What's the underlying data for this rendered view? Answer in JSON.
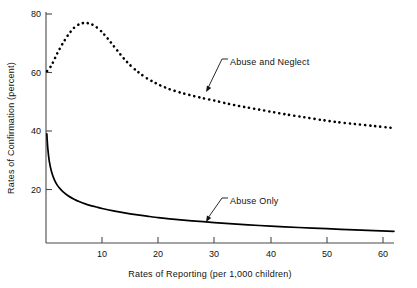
{
  "chart_data": {
    "type": "line",
    "title": "",
    "xlabel": "Rates of Reporting (per 1,000 children)",
    "ylabel": "Rates of Confirmation (percent)",
    "xlim": [
      0,
      62
    ],
    "ylim": [
      2,
      80
    ],
    "xticks": [
      10,
      20,
      30,
      40,
      50,
      60
    ],
    "yticks": [
      20,
      40,
      60,
      80
    ],
    "grid": false,
    "legend_position": "inline-annotations",
    "series": [
      {
        "name": "Abuse and Neglect",
        "style": "dotted",
        "x": [
          0.2,
          1,
          2,
          3,
          4,
          5,
          6,
          7,
          8,
          9,
          10,
          11,
          12,
          13,
          14,
          15,
          16,
          17,
          18,
          19,
          20,
          22,
          24,
          26,
          28,
          30,
          32,
          34,
          36,
          38,
          40,
          43,
          46,
          49,
          52,
          55,
          58,
          62
        ],
        "values": [
          60.5,
          62.5,
          66.5,
          70.0,
          73.0,
          75.3,
          76.6,
          77.0,
          76.6,
          75.5,
          73.8,
          71.6,
          69.2,
          66.8,
          64.5,
          62.5,
          60.8,
          59.3,
          58.0,
          56.9,
          55.9,
          54.3,
          53.1,
          52.1,
          51.2,
          50.4,
          49.5,
          48.7,
          48.0,
          47.3,
          46.6,
          45.6,
          44.7,
          43.8,
          43.0,
          42.4,
          41.8,
          41.0
        ]
      },
      {
        "name": "Abuse Only",
        "style": "solid",
        "x": [
          0.15,
          0.3,
          0.6,
          1,
          1.5,
          2,
          2.5,
          3,
          4,
          5,
          6,
          7,
          8,
          9,
          10,
          12,
          14,
          16,
          18,
          20,
          24,
          28,
          32,
          36,
          40,
          45,
          50,
          55,
          62
        ],
        "values": [
          39.0,
          34.5,
          29.5,
          26.0,
          23.3,
          21.5,
          20.3,
          19.3,
          17.8,
          16.7,
          15.8,
          15.1,
          14.5,
          14.0,
          13.5,
          12.7,
          12.0,
          11.4,
          10.9,
          10.4,
          9.6,
          9.0,
          8.4,
          7.9,
          7.5,
          7.0,
          6.6,
          6.2,
          5.7
        ]
      }
    ],
    "annotations": [
      {
        "text": "Abuse and Neglect",
        "label_x": 230,
        "label_y": 62,
        "point_x": 206,
        "point_y": 92
      },
      {
        "text": "Abuse Only",
        "label_x": 230,
        "label_y": 201,
        "point_x": 206,
        "point_y": 222
      }
    ]
  },
  "axes": {
    "y_tick_labels": [
      "80",
      "60",
      "40",
      "20"
    ],
    "x_tick_labels": [
      "10",
      "20",
      "30",
      "40",
      "50",
      "60"
    ],
    "y_axis_title": "Rates of Confirmation (percent)",
    "x_axis_title": "Rates of Reporting (per 1,000 children)"
  }
}
